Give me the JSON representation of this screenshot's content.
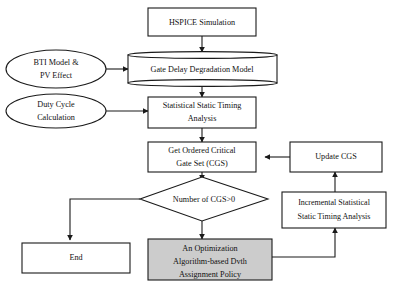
{
  "diagram": {
    "background_color": "#ffffff",
    "line_color": "#1a1a1a",
    "fill_default": "#ffffff",
    "fill_highlight": "#cccccc",
    "nodes": {
      "hspice": {
        "label": "HSPICE Simulation",
        "shape": "rectangle"
      },
      "bti": {
        "line1": "BTI Model &",
        "line2": "PV Effect",
        "shape": "ellipse"
      },
      "gate_delay": {
        "label": "Gate Delay Degradation Model",
        "shape": "cylinder"
      },
      "duty_cycle": {
        "line1": "Duty Cycle",
        "line2": "Calculation",
        "shape": "ellipse"
      },
      "ssta": {
        "line1": "Statistical Static Timing",
        "line2": "Analysis",
        "shape": "rectangle"
      },
      "cgs": {
        "line1": "Get Ordered Critical",
        "line2": "Gate Set (CGS)",
        "shape": "rectangle"
      },
      "update_cgs": {
        "label": "Update CGS",
        "shape": "rectangle"
      },
      "decision": {
        "label": "Number of CGS>0",
        "shape": "diamond"
      },
      "incremental": {
        "line1": "Incremental Statistical",
        "line2": "Static Timing Analysis",
        "shape": "rectangle"
      },
      "optimization": {
        "line1": "An Optimization",
        "line2": "Algorithm-based Dvth",
        "line3": "Assignment Policy",
        "shape": "rectangle",
        "fill": "#cccccc"
      },
      "end": {
        "label": "End",
        "shape": "rectangle"
      }
    }
  }
}
